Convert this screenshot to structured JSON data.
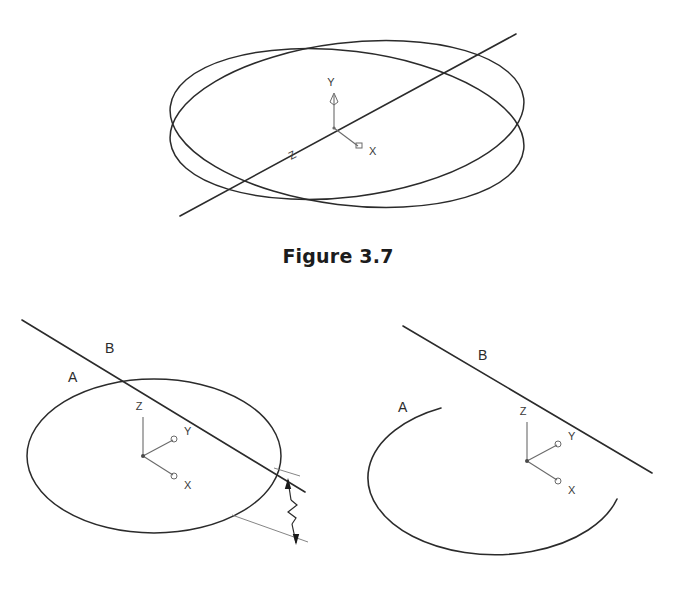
{
  "document": {
    "background_color": "#ffffff",
    "ink_color": "#2b2b2b",
    "axis_ink_color": "#6a6a6a"
  },
  "figures": [
    {
      "id": "figure-3-7",
      "caption": "Figure 3.7",
      "description": "Two intersecting ellipses viewed in isometric projection with a straight line passing through both intersection points",
      "axis_triad": {
        "vertical_label": "Y",
        "upper_label": "Z",
        "lower_right_label": "X"
      },
      "labels": {
        "y": "Y",
        "x": "X",
        "z": "Z"
      }
    },
    {
      "id": "figure-3-8",
      "caption": "Figure 3.8",
      "description": "Two side-by-side views: a complete ellipse crossed by a line, and a trimmed open arc with the line clear of it",
      "left_view": {
        "curve_label": "A",
        "line_label": "B",
        "axis": {
          "vertical": "Z",
          "upper_right": "Y",
          "lower_right": "X"
        },
        "dimension": {
          "type": "break-line",
          "arrows": "both-ends"
        }
      },
      "right_view": {
        "curve_label": "A",
        "line_label": "B",
        "axis": {
          "vertical": "Z",
          "upper_right": "Y",
          "lower_right": "X"
        }
      }
    }
  ]
}
